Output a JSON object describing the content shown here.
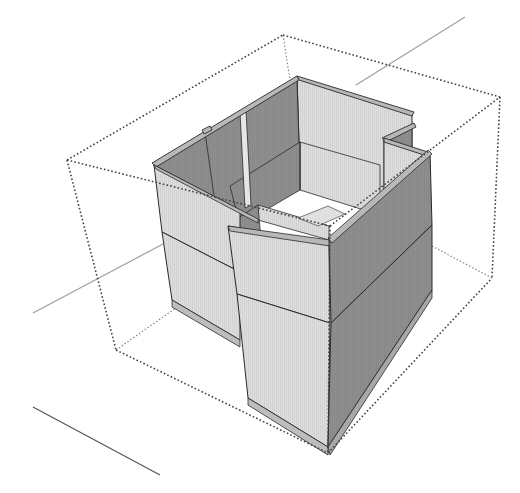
{
  "diagram": {
    "type": "3d-model-view",
    "colors": {
      "background": "#ffffff",
      "light_face": "#dcdcdc",
      "dark_face": "#8e8e8e",
      "mid_face": "#b4b4b4",
      "edge": "#2a2a2a",
      "bounding_box": "#555555",
      "axis_green": "#9a9a9a",
      "axis_red": "#555555",
      "base_strip": "#bdbdbd"
    }
  }
}
